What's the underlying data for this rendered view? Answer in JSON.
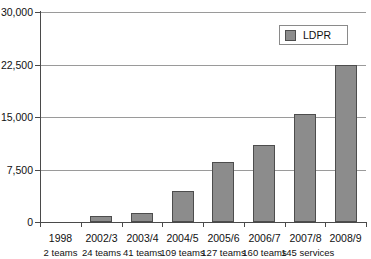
{
  "chart_data": {
    "type": "bar",
    "title": "",
    "xlabel": "",
    "ylabel": "",
    "ylim": [
      0,
      30000
    ],
    "grid": true,
    "legend_position": "top-right",
    "categories": [
      "1998",
      "2002/3",
      "2003/4",
      "2004/5",
      "2005/6",
      "2006/7",
      "2007/8",
      "2008/9"
    ],
    "category_sublabels": [
      "2 teams",
      "24 teams",
      "41 teams",
      "109 teams",
      "127 teams",
      "160 teams",
      "145 services"
    ],
    "series": [
      {
        "name": "LDPR",
        "values": [
          0,
          850,
          1300,
          4400,
          8500,
          11000,
          15400,
          22400
        ]
      }
    ],
    "ytick_labels": [
      "0",
      "7,500",
      "15,000",
      "22,500",
      "30,000"
    ],
    "ytick_values": [
      0,
      7500,
      15000,
      22500,
      30000
    ],
    "colors": {
      "bar_fill": "#8c8c8c",
      "bar_stroke": "#4d4d4d",
      "gridline": "#9a9a9a",
      "axis": "#4a4a4a",
      "text": "#111111",
      "background": "#ffffff"
    }
  },
  "legend": {
    "entries": [
      {
        "label": "LDPR",
        "swatch_name": "ldpr-swatch"
      }
    ]
  }
}
